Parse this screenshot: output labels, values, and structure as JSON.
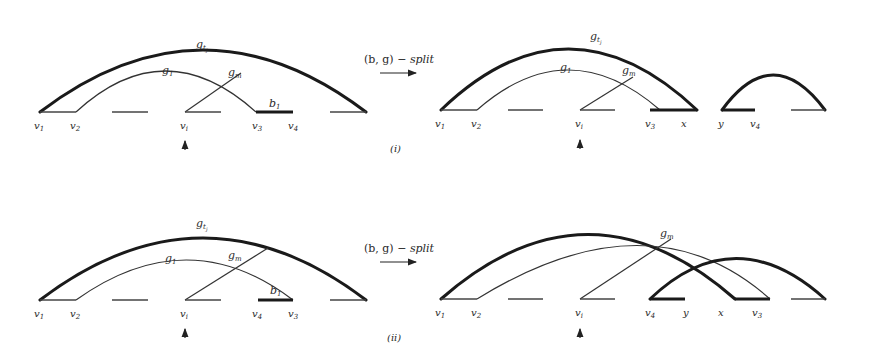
{
  "figure": {
    "panels": [
      {
        "id": "i",
        "caption": "(i)",
        "operation_label": "(b, g) − split",
        "before": {
          "arcs": [
            {
              "name": "g",
              "subscript": "t_j",
              "weight": "thick"
            },
            {
              "name": "g",
              "subscript": "1",
              "weight": "thin"
            },
            {
              "name": "g",
              "subscript": "m",
              "weight": "thin"
            }
          ],
          "block_label": {
            "name": "b",
            "subscript": "1"
          },
          "vertices": [
            "v1",
            "v2",
            "vi",
            "v3",
            "v4"
          ]
        },
        "after": {
          "arcs": [
            {
              "name": "g",
              "subscript": "t_j",
              "weight": "thick"
            },
            {
              "name": "g",
              "subscript": "1",
              "weight": "thin"
            },
            {
              "name": "g",
              "subscript": "m",
              "weight": "thin"
            }
          ],
          "vertices": [
            "v1",
            "v2",
            "vi",
            "v3",
            "x",
            "y",
            "v4"
          ]
        }
      },
      {
        "id": "ii",
        "caption": "(ii)",
        "operation_label": "(b, g) − split",
        "before": {
          "arcs": [
            {
              "name": "g",
              "subscript": "t_j",
              "weight": "thick"
            },
            {
              "name": "g",
              "subscript": "1",
              "weight": "thin"
            },
            {
              "name": "g",
              "subscript": "m",
              "weight": "thin"
            }
          ],
          "block_label": {
            "name": "b",
            "subscript": "1"
          },
          "vertices": [
            "v1",
            "v2",
            "vi",
            "v4",
            "v3"
          ]
        },
        "after": {
          "arcs": [
            {
              "name": "g",
              "subscript": "m",
              "weight": "thin"
            }
          ],
          "vertices": [
            "v1",
            "v2",
            "vi",
            "v4",
            "y",
            "x",
            "v3"
          ]
        }
      }
    ],
    "labels": {
      "g": "g",
      "b": "b",
      "sub_tj": "t",
      "sub_tj_j": "j",
      "sub_1": "1",
      "sub_m": "m",
      "v": "v",
      "v1": "1",
      "v2": "2",
      "vi": "i",
      "v3": "3",
      "v4": "4",
      "x": "x",
      "y": "y",
      "op_b": "(b, g) − ",
      "op_split": "split",
      "cap_i": "(i)",
      "cap_ii": "(ii)"
    }
  }
}
